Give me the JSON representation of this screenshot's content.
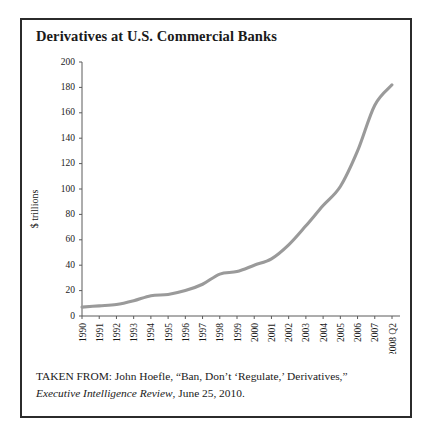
{
  "figure": {
    "title": "Derivatives at U.S. Commercial Banks",
    "caption_line1": "TAKEN FROM: John Hoefle, “Ban, Don’t ‘Regulate,’ Derivatives,”",
    "caption_source_italic": "Executive Intelligence Review",
    "caption_line2_rest": ", June 25, 2010.",
    "frame_color": "#2b2b2b",
    "background_color": "#ffffff"
  },
  "chart_data": {
    "type": "line",
    "title": "Derivatives at U.S. Commercial Banks",
    "xlabel": "",
    "ylabel": "$ trillions",
    "ylim": [
      0,
      200
    ],
    "yticks": [
      0,
      20,
      40,
      60,
      80,
      100,
      120,
      140,
      160,
      180,
      200
    ],
    "grid": false,
    "legend": "none",
    "line_color": "#9a9a9a",
    "categories": [
      "1990",
      "1991",
      "1992",
      "1993",
      "1994",
      "1995",
      "1996",
      "1997",
      "1998",
      "1999",
      "2000",
      "2001",
      "2002",
      "2003",
      "2004",
      "2005",
      "2006",
      "2007",
      "2008 Q2"
    ],
    "values": [
      7,
      8,
      9,
      12,
      16,
      17,
      20,
      25,
      33,
      35,
      40,
      45,
      56,
      71,
      87,
      102,
      130,
      166,
      182
    ],
    "units": "trillions of U.S. dollars"
  }
}
